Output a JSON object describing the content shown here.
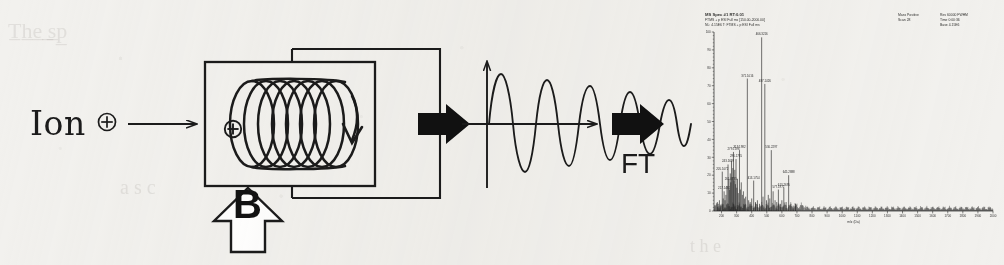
{
  "figure": {
    "kind": "ft-icr-mass-spectrometry-schematic",
    "background_color": "#f2f1ee",
    "ink_color": "#1b1b1b"
  },
  "stage_1": {
    "ion_text": "Ion",
    "charge_symbol": "⊕",
    "arrow_name": "ion-injection-arrow"
  },
  "stage_2": {
    "cell_name": "icr-cell",
    "field_label": "B",
    "trajectory_name": "ion-cyclotron-helix",
    "entry_charge_symbol": "⊕",
    "loops": 7
  },
  "stage_3": {
    "transient_name": "fid-transient-waveform",
    "cycles": 7,
    "axis_vertical": "signal-axis",
    "axis_horizontal": "time-axis"
  },
  "stage_4": {
    "transform_label": "FT",
    "arrow_name": "fourier-transform-arrow"
  },
  "spectrum": {
    "title": "MS Spec  #1 RT:0.01",
    "subtitle_1": "FTMS + p ESI Full ms  [150.00-2000.00]",
    "subtitle_2": "NL: 4.15E6   T: FTMS + p ESI Full ms",
    "meta": [
      {
        "label": "Mass",
        "value": "Positive"
      },
      {
        "label": "Scan",
        "value": "28"
      },
      {
        "label": "Res",
        "value": "60000 FWHM"
      },
      {
        "label": "Time",
        "value": "0:00:36"
      },
      {
        "label": "Base",
        "value": "4.15E6"
      }
    ],
    "xlabel": "m/z (Da)",
    "ylabel": "Relative Abundance",
    "xticks": [
      "200",
      "300",
      "400",
      "500",
      "600",
      "700",
      "800",
      "900",
      "1000",
      "1100",
      "1200",
      "1300",
      "1400",
      "1500",
      "1600",
      "1700",
      "1800",
      "1900",
      "2000"
    ],
    "yticks": [
      "0",
      "10",
      "20",
      "30",
      "40",
      "50",
      "60",
      "70",
      "80",
      "90",
      "100"
    ],
    "labeled_peaks": [
      {
        "mz": "205.1072",
        "intensity": 22
      },
      {
        "mz": "217.1461",
        "intensity": 11
      },
      {
        "mz": "243.1699",
        "intensity": 26
      },
      {
        "mz": "261.0735",
        "intensity": 16
      },
      {
        "mz": "279.1596",
        "intensity": 33
      },
      {
        "mz": "296.1735",
        "intensity": 29
      },
      {
        "mz": "319.1982",
        "intensity": 34
      },
      {
        "mz": "371.1016",
        "intensity": 74
      },
      {
        "mz": "413.1754",
        "intensity": 17
      },
      {
        "mz": "466.3216",
        "intensity": 97
      },
      {
        "mz": "487.1426",
        "intensity": 71
      },
      {
        "mz": "530.2297",
        "intensity": 34
      },
      {
        "mz": "577.1972",
        "intensity": 12
      },
      {
        "mz": "613.2695",
        "intensity": 13
      },
      {
        "mz": "645.2888",
        "intensity": 20
      }
    ]
  },
  "chart_data": {
    "type": "line",
    "title": "MS Spec  #1 RT:0.01",
    "xlabel": "m/z (Da)",
    "ylabel": "Relative Abundance",
    "xlim": [
      150,
      2000
    ],
    "ylim": [
      0,
      100
    ],
    "grid": false,
    "legend": "none",
    "peaks": [
      {
        "mz": 172,
        "intensity": 5
      },
      {
        "mz": 178,
        "intensity": 4
      },
      {
        "mz": 186,
        "intensity": 6
      },
      {
        "mz": 192,
        "intensity": 3
      },
      {
        "mz": 205,
        "intensity": 22
      },
      {
        "mz": 211,
        "intensity": 7
      },
      {
        "mz": 217,
        "intensity": 11
      },
      {
        "mz": 223,
        "intensity": 6
      },
      {
        "mz": 229,
        "intensity": 9
      },
      {
        "mz": 236,
        "intensity": 14
      },
      {
        "mz": 243,
        "intensity": 26
      },
      {
        "mz": 248,
        "intensity": 18
      },
      {
        "mz": 253,
        "intensity": 12
      },
      {
        "mz": 258,
        "intensity": 21
      },
      {
        "mz": 261,
        "intensity": 16
      },
      {
        "mz": 266,
        "intensity": 28
      },
      {
        "mz": 271,
        "intensity": 19
      },
      {
        "mz": 275,
        "intensity": 24
      },
      {
        "mz": 279,
        "intensity": 33
      },
      {
        "mz": 283,
        "intensity": 17
      },
      {
        "mz": 288,
        "intensity": 23
      },
      {
        "mz": 292,
        "intensity": 15
      },
      {
        "mz": 296,
        "intensity": 29
      },
      {
        "mz": 301,
        "intensity": 13
      },
      {
        "mz": 306,
        "intensity": 18
      },
      {
        "mz": 311,
        "intensity": 10
      },
      {
        "mz": 319,
        "intensity": 34
      },
      {
        "mz": 325,
        "intensity": 12
      },
      {
        "mz": 331,
        "intensity": 16
      },
      {
        "mz": 338,
        "intensity": 9
      },
      {
        "mz": 345,
        "intensity": 11
      },
      {
        "mz": 352,
        "intensity": 7
      },
      {
        "mz": 360,
        "intensity": 8
      },
      {
        "mz": 371,
        "intensity": 74
      },
      {
        "mz": 380,
        "intensity": 6
      },
      {
        "mz": 390,
        "intensity": 5
      },
      {
        "mz": 400,
        "intensity": 7
      },
      {
        "mz": 413,
        "intensity": 17
      },
      {
        "mz": 425,
        "intensity": 5
      },
      {
        "mz": 438,
        "intensity": 6
      },
      {
        "mz": 452,
        "intensity": 4
      },
      {
        "mz": 466,
        "intensity": 97
      },
      {
        "mz": 475,
        "intensity": 8
      },
      {
        "mz": 487,
        "intensity": 71
      },
      {
        "mz": 498,
        "intensity": 6
      },
      {
        "mz": 510,
        "intensity": 9
      },
      {
        "mz": 520,
        "intensity": 7
      },
      {
        "mz": 530,
        "intensity": 34
      },
      {
        "mz": 542,
        "intensity": 11
      },
      {
        "mz": 555,
        "intensity": 6
      },
      {
        "mz": 566,
        "intensity": 5
      },
      {
        "mz": 577,
        "intensity": 12
      },
      {
        "mz": 590,
        "intensity": 4
      },
      {
        "mz": 600,
        "intensity": 6
      },
      {
        "mz": 613,
        "intensity": 13
      },
      {
        "mz": 628,
        "intensity": 5
      },
      {
        "mz": 645,
        "intensity": 20
      },
      {
        "mz": 660,
        "intensity": 4
      },
      {
        "mz": 675,
        "intensity": 3
      },
      {
        "mz": 690,
        "intensity": 4
      }
    ],
    "baseline_noise_amplitude": 2
  }
}
